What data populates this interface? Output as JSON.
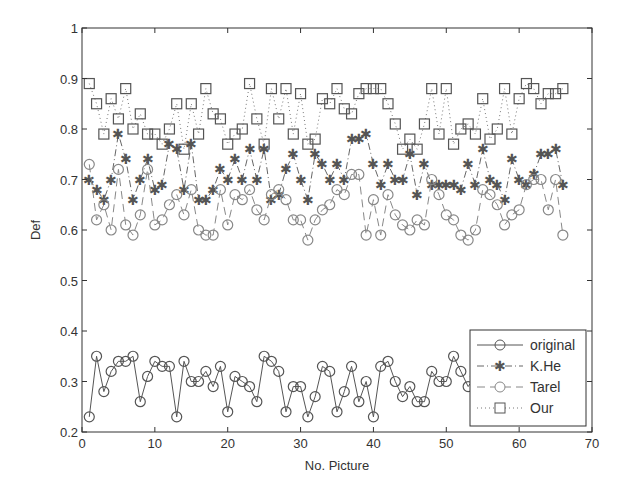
{
  "chart_data": {
    "type": "line",
    "title": "",
    "xlabel": "No. Picture",
    "ylabel": "Def",
    "xlim": [
      0,
      70
    ],
    "ylim": [
      0.2,
      1
    ],
    "xticks": [
      0,
      10,
      20,
      30,
      40,
      50,
      60,
      70
    ],
    "yticks": [
      0.2,
      0.3,
      0.4,
      0.5,
      0.6,
      0.7,
      0.8,
      0.9,
      1
    ],
    "ytick_labels": [
      "0.2",
      "0.3",
      "0.4",
      "0.5",
      "0.6",
      "0.7",
      "0.8",
      "0.9",
      "1"
    ],
    "grid": false,
    "legend_position": "lower right",
    "x": [
      1,
      2,
      3,
      4,
      5,
      6,
      7,
      8,
      9,
      10,
      11,
      12,
      13,
      14,
      15,
      16,
      17,
      18,
      19,
      20,
      21,
      22,
      23,
      24,
      25,
      26,
      27,
      28,
      29,
      30,
      31,
      32,
      33,
      34,
      35,
      36,
      37,
      38,
      39,
      40,
      41,
      42,
      43,
      44,
      45,
      46,
      47,
      48,
      49,
      50,
      51,
      52,
      53,
      54,
      55,
      56,
      57,
      58,
      59,
      60,
      61,
      62,
      63,
      64,
      65,
      66
    ],
    "series": [
      {
        "name": "original",
        "style": "solid",
        "marker": "circle",
        "values": [
          0.23,
          0.35,
          0.28,
          0.32,
          0.34,
          0.34,
          0.35,
          0.26,
          0.31,
          0.34,
          0.33,
          0.33,
          0.23,
          0.34,
          0.3,
          0.3,
          0.32,
          0.29,
          0.33,
          0.24,
          0.31,
          0.3,
          0.29,
          0.26,
          0.35,
          0.34,
          0.32,
          0.24,
          0.29,
          0.29,
          0.23,
          0.27,
          0.33,
          0.32,
          0.24,
          0.28,
          0.33,
          0.26,
          0.3,
          0.23,
          0.33,
          0.34,
          0.3,
          0.27,
          0.29,
          0.26,
          0.26,
          0.32,
          0.3,
          0.3,
          0.35,
          0.32,
          0.29,
          0.31,
          0.27,
          0.32,
          0.3,
          0.25,
          0.3,
          0.34,
          0.34,
          0.32,
          0.33,
          0.3,
          0.33,
          0.35
        ]
      },
      {
        "name": "K.He",
        "style": "dashdot",
        "marker": "star",
        "values": [
          0.7,
          0.68,
          0.66,
          0.7,
          0.79,
          0.74,
          0.66,
          0.7,
          0.74,
          0.68,
          0.69,
          0.77,
          0.76,
          0.68,
          0.77,
          0.66,
          0.66,
          0.68,
          0.72,
          0.7,
          0.74,
          0.7,
          0.76,
          0.7,
          0.76,
          0.66,
          0.67,
          0.72,
          0.75,
          0.7,
          0.66,
          0.75,
          0.73,
          0.7,
          0.73,
          0.7,
          0.78,
          0.78,
          0.79,
          0.73,
          0.69,
          0.73,
          0.7,
          0.7,
          0.75,
          0.67,
          0.73,
          0.69,
          0.69,
          0.69,
          0.69,
          0.68,
          0.73,
          0.69,
          0.76,
          0.7,
          0.69,
          0.66,
          0.74,
          0.7,
          0.69,
          0.71,
          0.75,
          0.75,
          0.76,
          0.69
        ]
      },
      {
        "name": "Tarel",
        "style": "dashed",
        "marker": "circle-light",
        "values": [
          0.73,
          0.62,
          0.65,
          0.6,
          0.72,
          0.61,
          0.59,
          0.63,
          0.72,
          0.61,
          0.62,
          0.65,
          0.67,
          0.63,
          0.68,
          0.6,
          0.59,
          0.59,
          0.68,
          0.61,
          0.67,
          0.66,
          0.68,
          0.64,
          0.62,
          0.67,
          0.68,
          0.66,
          0.62,
          0.62,
          0.58,
          0.62,
          0.64,
          0.65,
          0.68,
          0.67,
          0.71,
          0.71,
          0.59,
          0.66,
          0.59,
          0.67,
          0.63,
          0.61,
          0.6,
          0.62,
          0.61,
          0.7,
          0.67,
          0.63,
          0.62,
          0.59,
          0.58,
          0.6,
          0.68,
          0.67,
          0.65,
          0.61,
          0.63,
          0.64,
          0.69,
          0.7,
          0.7,
          0.64,
          0.7,
          0.59
        ]
      },
      {
        "name": "Our",
        "style": "dotted",
        "marker": "square",
        "values": [
          0.89,
          0.85,
          0.79,
          0.86,
          0.82,
          0.88,
          0.8,
          0.83,
          0.79,
          0.79,
          0.77,
          0.8,
          0.85,
          0.76,
          0.85,
          0.79,
          0.88,
          0.83,
          0.82,
          0.77,
          0.79,
          0.8,
          0.89,
          0.82,
          0.77,
          0.88,
          0.82,
          0.88,
          0.79,
          0.87,
          0.77,
          0.78,
          0.86,
          0.85,
          0.88,
          0.84,
          0.83,
          0.87,
          0.88,
          0.88,
          0.88,
          0.85,
          0.81,
          0.76,
          0.78,
          0.76,
          0.81,
          0.88,
          0.79,
          0.88,
          0.77,
          0.8,
          0.81,
          0.79,
          0.86,
          0.78,
          0.8,
          0.88,
          0.79,
          0.86,
          0.89,
          0.88,
          0.85,
          0.87,
          0.87,
          0.88
        ]
      }
    ]
  },
  "legend": {
    "items": [
      {
        "label": "original"
      },
      {
        "label": "K.He"
      },
      {
        "label": "Tarel"
      },
      {
        "label": "Our"
      }
    ]
  },
  "colors": {
    "original": "#555555",
    "khe": "#666666",
    "tarel": "#888888",
    "our": "#555555",
    "axes": "#333333"
  }
}
